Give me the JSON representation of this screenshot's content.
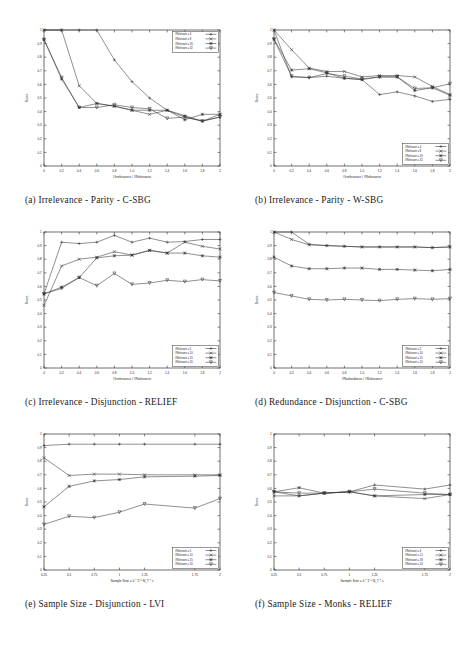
{
  "figure": {
    "name": "feature-selection-evaluation-figure",
    "panel_count": 6
  },
  "panels": [
    {
      "id": "a",
      "caption": "(a) Irrelevance - Parity - C-SBG",
      "legend_position": "top-right",
      "chart_data": {
        "type": "line",
        "title": "",
        "xlabel": "#Irrelevance / #Relevance",
        "ylabel": "Score",
        "xlim": [
          0,
          2
        ],
        "ylim": [
          0,
          1
        ],
        "xticks": [
          0,
          0.2,
          0.4,
          0.6,
          0.8,
          1.0,
          1.2,
          1.4,
          1.6,
          1.8,
          2
        ],
        "xticklabels": [
          "0",
          "0.2",
          "0.4",
          "0.6",
          "0.8",
          "1.0",
          "1.2",
          "1.4",
          "1.6",
          "1.8",
          "2"
        ],
        "yticks": [
          0,
          0.1,
          0.2,
          0.3,
          0.4,
          0.5,
          0.6,
          0.7,
          0.8,
          0.9,
          1
        ],
        "yticklabels": [
          "0",
          "0.1",
          "0.2",
          "0.3",
          "0.4",
          "0.5",
          "0.6",
          "0.7",
          "0.8",
          "0.9",
          "1"
        ],
        "grid": false,
        "x": [
          0,
          0.2,
          0.4,
          0.6,
          0.8,
          1.0,
          1.2,
          1.4,
          1.6,
          1.8,
          2
        ],
        "series": [
          {
            "name": "#Relevant = 4",
            "marker": "plus",
            "values": [
              1.0,
              1.0,
              1.0,
              1.0,
              0.78,
              0.62,
              0.5,
              0.41,
              0.37,
              0.33,
              0.36
            ]
          },
          {
            "name": "#Relevant = 8",
            "marker": "cross",
            "values": [
              1.0,
              1.0,
              0.59,
              0.46,
              0.44,
              0.41,
              0.38,
              0.41,
              0.36,
              0.33,
              0.38
            ]
          },
          {
            "name": "#Relevant = 16",
            "marker": "star",
            "values": [
              0.93,
              0.64,
              0.43,
              0.46,
              0.44,
              0.41,
              0.41,
              0.41,
              0.34,
              0.38,
              0.38
            ]
          },
          {
            "name": "#Relevant = 32",
            "marker": "tri",
            "values": [
              0.93,
              0.65,
              0.43,
              0.43,
              0.45,
              0.43,
              0.42,
              0.35,
              0.36,
              0.33,
              0.36
            ]
          }
        ]
      }
    },
    {
      "id": "b",
      "caption": "(b) Irrelevance - Parity - W-SBG",
      "legend_position": "bottom-right",
      "chart_data": {
        "type": "line",
        "title": "",
        "xlabel": "#Irrelevance / #Relevance",
        "ylabel": "Score",
        "xlim": [
          0,
          2
        ],
        "ylim": [
          0,
          1
        ],
        "xticks": [
          0,
          0.2,
          0.4,
          0.6,
          0.8,
          1.0,
          1.2,
          1.4,
          1.6,
          1.8,
          2
        ],
        "xticklabels": [
          "0",
          "0.2",
          "0.4",
          "0.6",
          "0.8",
          "1.0",
          "1.2",
          "1.4",
          "1.6",
          "1.8",
          "2"
        ],
        "yticks": [
          0,
          0.1,
          0.2,
          0.3,
          0.4,
          0.5,
          0.6,
          0.7,
          0.8,
          0.9,
          1
        ],
        "yticklabels": [
          "0",
          "0.1",
          "0.2",
          "0.3",
          "0.4",
          "0.5",
          "0.6",
          "0.7",
          "0.8",
          "0.9",
          "1"
        ],
        "grid": false,
        "x": [
          0,
          0.2,
          0.4,
          0.6,
          0.8,
          1.0,
          1.2,
          1.4,
          1.6,
          1.8,
          2
        ],
        "series": [
          {
            "name": "#Relevant = 4",
            "marker": "plus",
            "values": [
              1.0,
              0.655,
              0.65,
              0.66,
              0.645,
              0.635,
              0.525,
              0.545,
              0.515,
              0.475,
              0.49
            ]
          },
          {
            "name": "#Relevant = 8",
            "marker": "cross",
            "values": [
              1.0,
              0.855,
              0.72,
              0.695,
              0.695,
              0.655,
              0.665,
              0.665,
              0.655,
              0.585,
              0.525
            ]
          },
          {
            "name": "#Relevant = 16",
            "marker": "star",
            "values": [
              0.935,
              0.705,
              0.715,
              0.685,
              0.645,
              0.635,
              0.655,
              0.655,
              0.555,
              0.575,
              0.52
            ]
          },
          {
            "name": "#Relevant = 32",
            "marker": "tri",
            "values": [
              0.93,
              0.66,
              0.65,
              0.68,
              0.66,
              0.64,
              0.655,
              0.655,
              0.57,
              0.575,
              0.605
            ]
          }
        ]
      }
    },
    {
      "id": "c",
      "caption": "(c) Irrelevance - Disjunction - RELIEF",
      "legend_position": "bottom-right",
      "chart_data": {
        "type": "line",
        "title": "",
        "xlabel": "#Irrelevance / #Relevance",
        "ylabel": "Score",
        "xlim": [
          0,
          2
        ],
        "ylim": [
          0,
          1
        ],
        "xticks": [
          0,
          0.2,
          0.4,
          0.6,
          0.8,
          1.0,
          1.2,
          1.4,
          1.6,
          1.8,
          2
        ],
        "xticklabels": [
          "0",
          "0.2",
          "0.4",
          "0.6",
          "0.8",
          "1.0",
          "1.2",
          "1.4",
          "1.6",
          "1.8",
          "2"
        ],
        "yticks": [
          0,
          0.1,
          0.2,
          0.3,
          0.4,
          0.5,
          0.6,
          0.7,
          0.8,
          0.9,
          1
        ],
        "yticklabels": [
          "0",
          "0.1",
          "0.2",
          "0.3",
          "0.4",
          "0.5",
          "0.6",
          "0.7",
          "0.8",
          "0.9",
          "1"
        ],
        "grid": false,
        "x": [
          0,
          0.2,
          0.4,
          0.6,
          0.8,
          1.0,
          1.2,
          1.4,
          1.6,
          1.8,
          2
        ],
        "series": [
          {
            "name": "#Relevant = 5",
            "marker": "plus",
            "values": [
              0.545,
              0.925,
              0.915,
              0.925,
              0.975,
              0.925,
              0.955,
              0.925,
              0.93,
              0.945,
              0.945
            ]
          },
          {
            "name": "#Relevant = 10",
            "marker": "cross",
            "values": [
              0.46,
              0.75,
              0.8,
              0.815,
              0.855,
              0.83,
              0.865,
              0.845,
              0.925,
              0.895,
              0.875
            ]
          },
          {
            "name": "#Relevant = 15",
            "marker": "star",
            "values": [
              0.545,
              0.595,
              0.665,
              0.81,
              0.825,
              0.83,
              0.865,
              0.845,
              0.845,
              0.825,
              0.815
            ]
          },
          {
            "name": "#Relevant = 20",
            "marker": "tri",
            "values": [
              0.545,
              0.585,
              0.665,
              0.605,
              0.695,
              0.615,
              0.625,
              0.645,
              0.635,
              0.65,
              0.64
            ]
          }
        ]
      }
    },
    {
      "id": "d",
      "caption": "(d) Redundance - Disjunction - C-SBG",
      "legend_position": "bottom-right",
      "chart_data": {
        "type": "line",
        "title": "",
        "xlabel": "#Redundance / #Relevance",
        "ylabel": "Score",
        "xlim": [
          0,
          2
        ],
        "ylim": [
          0,
          1
        ],
        "xticks": [
          0,
          0.2,
          0.4,
          0.6,
          0.8,
          1.0,
          1.2,
          1.4,
          1.6,
          1.8,
          2
        ],
        "xticklabels": [
          "0",
          "0.2",
          "0.4",
          "0.6",
          "0.8",
          "1.0",
          "1.2",
          "1.4",
          "1.6",
          "1.8",
          "2"
        ],
        "yticks": [
          0,
          0.1,
          0.2,
          0.3,
          0.4,
          0.5,
          0.6,
          0.7,
          0.8,
          0.9,
          1
        ],
        "yticklabels": [
          "0",
          "0.1",
          "0.2",
          "0.3",
          "0.4",
          "0.5",
          "0.6",
          "0.7",
          "0.8",
          "0.9",
          "1"
        ],
        "grid": false,
        "x": [
          0,
          0.2,
          0.4,
          0.6,
          0.8,
          1.0,
          1.2,
          1.4,
          1.6,
          1.8,
          2
        ],
        "series": [
          {
            "name": "#Relevant = 5",
            "marker": "plus",
            "values": [
              1.0,
              1.0,
              0.91,
              0.9,
              0.895,
              0.89,
              0.89,
              0.89,
              0.89,
              0.885,
              0.89
            ]
          },
          {
            "name": "#Relevant = 10",
            "marker": "cross",
            "values": [
              1.0,
              0.945,
              0.905,
              0.9,
              0.895,
              0.89,
              0.89,
              0.89,
              0.89,
              0.885,
              0.89
            ]
          },
          {
            "name": "#Relevant = 15",
            "marker": "star",
            "values": [
              0.815,
              0.75,
              0.73,
              0.73,
              0.735,
              0.735,
              0.725,
              0.725,
              0.72,
              0.715,
              0.725
            ]
          },
          {
            "name": "#Relevant = 20",
            "marker": "tri",
            "values": [
              0.555,
              0.53,
              0.505,
              0.5,
              0.505,
              0.5,
              0.495,
              0.505,
              0.51,
              0.505,
              0.51
            ]
          }
        ]
      }
    },
    {
      "id": "e",
      "caption": "(e) Sample Size - Disjunction - LVI",
      "legend_position": "bottom-right",
      "chart_data": {
        "type": "line",
        "title": "",
        "xlabel": "Sample Size = k * 2 ^ N_T * c",
        "ylabel": "Score",
        "xlim": [
          0.25,
          2
        ],
        "ylim": [
          0,
          1
        ],
        "xticks": [
          0.25,
          0.5,
          0.75,
          1,
          1.25,
          1.75,
          2
        ],
        "xticklabels": [
          "0.25",
          "0.5",
          "0.75",
          "1",
          "1.25",
          "1.75",
          "2"
        ],
        "yticks": [
          0,
          0.1,
          0.2,
          0.3,
          0.4,
          0.5,
          0.6,
          0.7,
          0.8,
          0.9,
          1
        ],
        "yticklabels": [
          "0",
          "0.1",
          "0.2",
          "0.3",
          "0.4",
          "0.5",
          "0.6",
          "0.7",
          "0.8",
          "0.9",
          "1"
        ],
        "grid": false,
        "x": [
          0.25,
          0.5,
          0.75,
          1,
          1.25,
          1.75,
          2
        ],
        "series": [
          {
            "name": "#Relevant = 5",
            "marker": "plus",
            "values": [
              0.915,
              0.925,
              0.925,
              0.925,
              0.925,
              0.925,
              0.925
            ]
          },
          {
            "name": "#Relevant = 10",
            "marker": "cross",
            "values": [
              0.825,
              0.695,
              0.705,
              0.705,
              0.7,
              0.7,
              0.7
            ]
          },
          {
            "name": "#Relevant = 15",
            "marker": "star",
            "values": [
              0.465,
              0.615,
              0.655,
              0.665,
              0.685,
              0.69,
              0.695
            ]
          },
          {
            "name": "#Relevant = 20",
            "marker": "tri",
            "values": [
              0.335,
              0.395,
              0.385,
              0.425,
              0.485,
              0.455,
              0.525
            ]
          }
        ]
      }
    },
    {
      "id": "f",
      "caption": "(f) Sample Size - Monks - RELIEF",
      "legend_position": "bottom-right",
      "chart_data": {
        "type": "line",
        "title": "",
        "xlabel": "Sample Size = k * 2 ^ N_T * c",
        "ylabel": "Score",
        "xlim": [
          0.25,
          2
        ],
        "ylim": [
          0,
          1
        ],
        "xticks": [
          0.25,
          0.5,
          0.75,
          1,
          1.25,
          1.75,
          2
        ],
        "xticklabels": [
          "0.25",
          "0.5",
          "0.75",
          "1",
          "1.25",
          "1.75",
          "2"
        ],
        "yticks": [
          0,
          0.1,
          0.2,
          0.3,
          0.4,
          0.5,
          0.6,
          0.7,
          0.8,
          0.9,
          1
        ],
        "yticklabels": [
          "0",
          "0.1",
          "0.2",
          "0.3",
          "0.4",
          "0.5",
          "0.6",
          "0.7",
          "0.8",
          "0.9",
          "1"
        ],
        "grid": false,
        "x": [
          0.25,
          0.5,
          0.75,
          1,
          1.25,
          1.75,
          2
        ],
        "series": [
          {
            "name": "#Relevant = 6",
            "marker": "plus",
            "values": [
              0.575,
              0.545,
              0.565,
              0.575,
              0.625,
              0.595,
              0.625
            ]
          },
          {
            "name": "#Relevant = 12",
            "marker": "cross",
            "values": [
              0.545,
              0.545,
              0.565,
              0.575,
              0.545,
              0.525,
              0.555
            ]
          },
          {
            "name": "#Relevant = 18",
            "marker": "star",
            "values": [
              0.575,
              0.605,
              0.565,
              0.575,
              0.545,
              0.555,
              0.555
            ]
          },
          {
            "name": "#Relevant = 24",
            "marker": "tri",
            "values": [
              0.575,
              0.565,
              0.565,
              0.575,
              0.595,
              0.565,
              0.555
            ]
          }
        ]
      }
    }
  ]
}
